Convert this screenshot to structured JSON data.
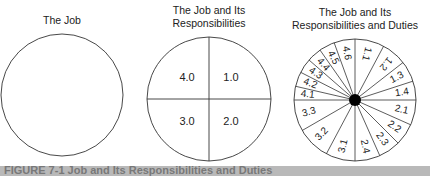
{
  "chart_data": [
    {
      "type": "pie",
      "title": "The Job",
      "segments": []
    },
    {
      "type": "pie",
      "title": "The Job and Its Responsibilities",
      "segments": [
        {
          "label": "1.0",
          "start": 0,
          "end": 90
        },
        {
          "label": "2.0",
          "start": 90,
          "end": 180
        },
        {
          "label": "3.0",
          "start": 180,
          "end": 270
        },
        {
          "label": "4.0",
          "start": 270,
          "end": 360
        }
      ]
    },
    {
      "type": "pie",
      "title": "The Job and Its Responsibilities and Duties",
      "center_dot": true,
      "segments": [
        {
          "label": "1.1",
          "start": 0,
          "end": 28
        },
        {
          "label": "1.2",
          "start": 28,
          "end": 52
        },
        {
          "label": "1.3",
          "start": 52,
          "end": 72
        },
        {
          "label": "1.4",
          "start": 72,
          "end": 90
        },
        {
          "label": "2.1",
          "start": 90,
          "end": 114
        },
        {
          "label": "2.2",
          "start": 114,
          "end": 135
        },
        {
          "label": "2.3",
          "start": 135,
          "end": 156
        },
        {
          "label": "2.4",
          "start": 156,
          "end": 180
        },
        {
          "label": "3.1",
          "start": 180,
          "end": 208
        },
        {
          "label": "3.2",
          "start": 208,
          "end": 240
        },
        {
          "label": "3.3",
          "start": 240,
          "end": 270
        },
        {
          "label": "4.1",
          "start": 270,
          "end": 283
        },
        {
          "label": "4.2",
          "start": 283,
          "end": 297
        },
        {
          "label": "4.3",
          "start": 297,
          "end": 311
        },
        {
          "label": "4.4",
          "start": 311,
          "end": 325
        },
        {
          "label": "4.5",
          "start": 325,
          "end": 340
        },
        {
          "label": "4.6",
          "start": 340,
          "end": 360
        }
      ]
    }
  ],
  "diagrams": {
    "job": {
      "title_lines": [
        "The Job"
      ],
      "cx": 62,
      "cy": 95,
      "r": 61
    },
    "responsibilities": {
      "title_lines": [
        "The Job and Its",
        "Responsibilities"
      ],
      "cx": 209,
      "cy": 99,
      "r": 62,
      "labels": [
        "1.0",
        "2.0",
        "3.0",
        "4.0"
      ]
    },
    "duties": {
      "title_lines": [
        "The Job and Its",
        "Responsibilities and Duties"
      ],
      "cx": 355,
      "cy": 100,
      "r": 61,
      "dot_r": 6
    }
  },
  "caption": {
    "text": "FIGURE 7-1  Job and Its Responsibilities and Duties"
  },
  "colors": {
    "stroke": "#333333",
    "text": "#222222",
    "dot": "#000000",
    "caption_bar": "#b9b9b9"
  }
}
